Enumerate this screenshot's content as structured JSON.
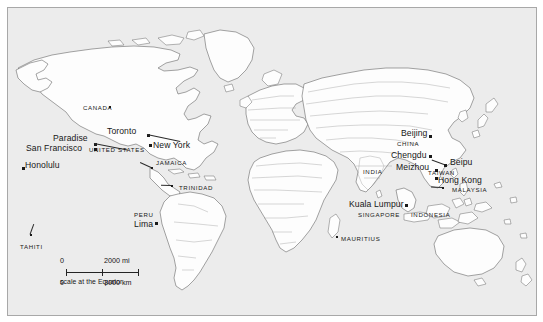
{
  "figure": {
    "name": "world-map",
    "ocean_color": "#ececec",
    "land_color": "#fdfdfd",
    "border_color": "#8c8c8c",
    "coast_color": "#555555",
    "label_color": "#171717",
    "frame_color": "#a8a8a8"
  },
  "labels": {
    "cities": [
      {
        "text": "Paradise",
        "x": 52,
        "y": 133,
        "dot_x": 93,
        "dot_y": 142,
        "leader": true,
        "leader_len": 34,
        "leader_angle": 11
      },
      {
        "text": "San Francisco",
        "x": 25,
        "y": 143,
        "dot_x": 93,
        "dot_y": 147,
        "leader": false
      },
      {
        "text": "Honolulu",
        "x": 24,
        "y": 160,
        "dot_x": 21,
        "dot_y": 166,
        "leader": false
      },
      {
        "text": "Toronto",
        "x": 106,
        "y": 126,
        "dot_x": 146,
        "dot_y": 133,
        "leader": true,
        "leader_len": 34,
        "leader_angle": 12
      },
      {
        "text": "New York",
        "x": 152,
        "y": 140,
        "dot_x": 148,
        "dot_y": 143,
        "leader": false
      },
      {
        "text": "Lima",
        "x": 133,
        "y": 219,
        "dot_x": 154,
        "dot_y": 221,
        "leader": false
      },
      {
        "text": "Beijing",
        "x": 400,
        "y": 128,
        "dot_x": 428,
        "dot_y": 134,
        "leader": false
      },
      {
        "text": "Chengdu",
        "x": 390,
        "y": 150,
        "dot_x": 428,
        "dot_y": 154,
        "leader": false
      },
      {
        "text": "Meizhou",
        "x": 395,
        "y": 162,
        "dot_x": 434,
        "dot_y": 168,
        "leader": false
      },
      {
        "text": "Beipu",
        "x": 449,
        "y": 157,
        "dot_x": 443,
        "dot_y": 163,
        "leader": true,
        "leader_len": 13,
        "leader_angle": 200
      },
      {
        "text": "Hong Kong",
        "x": 437,
        "y": 175,
        "dot_x": 434,
        "dot_y": 176,
        "leader": false
      },
      {
        "text": "Kuala Lumpur",
        "x": 348,
        "y": 199,
        "dot_x": 404,
        "dot_y": 203,
        "leader": false
      }
    ],
    "countries": [
      {
        "text": "CANADA",
        "x": 82,
        "y": 104,
        "dot_x": 108,
        "dot_y": 105,
        "leader": false
      },
      {
        "text": "UNITED STATES",
        "x": 88,
        "y": 146,
        "leader": false
      },
      {
        "text": "JAMAICA",
        "x": 155,
        "y": 159,
        "dot_x": 150,
        "dot_y": 166,
        "leader": true,
        "leader_len": 12,
        "leader_angle": 205
      },
      {
        "text": "TRINIDAD",
        "x": 178,
        "y": 184,
        "dot_x": 170,
        "dot_y": 184,
        "leader": true,
        "leader_len": 10,
        "leader_angle": 182
      },
      {
        "text": "PERU",
        "x": 133,
        "y": 211,
        "leader": false
      },
      {
        "text": "TAHITI",
        "x": 19,
        "y": 243,
        "dot_x": 29,
        "dot_y": 233,
        "leader": true,
        "leader_len": 11,
        "leader_angle": 290
      },
      {
        "text": "INDIA",
        "x": 362,
        "y": 168,
        "leader": false
      },
      {
        "text": "CHINA",
        "x": 396,
        "y": 140,
        "leader": false
      },
      {
        "text": "TAIWAN",
        "x": 427,
        "y": 169,
        "leader": false
      },
      {
        "text": "MALAYSIA",
        "x": 451,
        "y": 186,
        "dot_x": 441,
        "dot_y": 186,
        "leader": true,
        "leader_len": 11,
        "leader_angle": 182
      },
      {
        "text": "SINGAPORE",
        "x": 357,
        "y": 211,
        "leader": false
      },
      {
        "text": "INDONESIA",
        "x": 410,
        "y": 211,
        "leader": false
      },
      {
        "text": "MAURITIUS",
        "x": 340,
        "y": 235,
        "dot_x": 335,
        "dot_y": 235,
        "leader": false
      }
    ]
  },
  "scale": {
    "miles_zero": "0",
    "miles_value": "2000 mi",
    "km_zero": "0",
    "km_value": "3000 km",
    "caption": "scale at the Equator"
  }
}
